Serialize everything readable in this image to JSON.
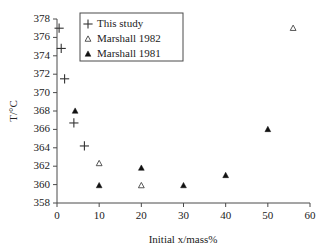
{
  "chart_data": {
    "type": "scatter",
    "title": "",
    "xlabel": "Initial x/mass%",
    "ylabel": "T/°C",
    "xlim": [
      0,
      60
    ],
    "ylim": [
      358,
      378
    ],
    "xticks": [
      0,
      10,
      20,
      30,
      40,
      50,
      60
    ],
    "yticks": [
      358,
      360,
      362,
      364,
      366,
      368,
      370,
      372,
      374,
      376,
      378
    ],
    "xtick_labels": [
      "0",
      "10",
      "20",
      "30",
      "40",
      "50",
      "60"
    ],
    "ytick_labels": [
      "358",
      "360",
      "362",
      "364",
      "366",
      "368",
      "370",
      "372",
      "374",
      "376",
      "378"
    ],
    "grid": false,
    "legend_position": "top-left-inside",
    "series": [
      {
        "name": "This study",
        "marker": "plus",
        "color": "#333333",
        "points": [
          {
            "x": 0.5,
            "y": 377.0
          },
          {
            "x": 1.0,
            "y": 374.8
          },
          {
            "x": 1.8,
            "y": 371.5
          },
          {
            "x": 4.0,
            "y": 366.7
          },
          {
            "x": 6.5,
            "y": 364.2
          }
        ]
      },
      {
        "name": "Marshall 1982",
        "marker": "triangle-open",
        "color": "#444444",
        "points": [
          {
            "x": 10.0,
            "y": 362.3
          },
          {
            "x": 20.0,
            "y": 359.9
          },
          {
            "x": 56.0,
            "y": 377.0
          }
        ]
      },
      {
        "name": "Marshall 1981",
        "marker": "triangle-filled",
        "color": "#111111",
        "points": [
          {
            "x": 4.3,
            "y": 368.0
          },
          {
            "x": 10.0,
            "y": 359.9
          },
          {
            "x": 20.0,
            "y": 361.8
          },
          {
            "x": 30.0,
            "y": 359.9
          },
          {
            "x": 40.0,
            "y": 361.0
          },
          {
            "x": 50.0,
            "y": 366.0
          }
        ]
      }
    ]
  },
  "legend": {
    "entries": [
      {
        "label": "This study",
        "marker": "plus"
      },
      {
        "label": "Marshall 1982",
        "marker": "triangle-open"
      },
      {
        "label": "Marshall 1981",
        "marker": "triangle-filled"
      }
    ]
  }
}
